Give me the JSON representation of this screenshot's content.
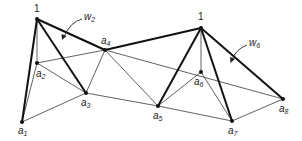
{
  "diagram": {
    "nodes": [
      {
        "id": "apex-left",
        "label": "1",
        "x": 37,
        "y": 19
      },
      {
        "id": "apex-right",
        "label": "1",
        "x": 201,
        "y": 28
      },
      {
        "id": "a1",
        "label": "a",
        "sub": "1",
        "x": 22,
        "y": 122
      },
      {
        "id": "a2",
        "label": "a",
        "sub": "2",
        "x": 37,
        "y": 63
      },
      {
        "id": "a3",
        "label": "a",
        "sub": "3",
        "x": 86,
        "y": 93
      },
      {
        "id": "a4",
        "label": "a",
        "sub": "4",
        "x": 105,
        "y": 50
      },
      {
        "id": "a5",
        "label": "a",
        "sub": "5",
        "x": 158,
        "y": 106
      },
      {
        "id": "a6",
        "label": "a",
        "sub": "6",
        "x": 201,
        "y": 72
      },
      {
        "id": "a7",
        "label": "a",
        "sub": "7",
        "x": 232,
        "y": 121
      },
      {
        "id": "a8",
        "label": "a",
        "sub": "8",
        "x": 283,
        "y": 99
      }
    ],
    "annotations": [
      {
        "id": "w2",
        "label": "w",
        "sub": "2"
      },
      {
        "id": "w6",
        "label": "w",
        "sub": "6"
      }
    ]
  }
}
